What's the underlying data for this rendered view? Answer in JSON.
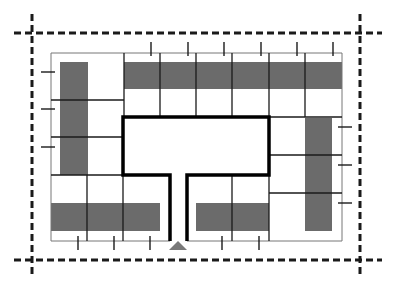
{
  "diagram": {
    "type": "site-plan",
    "colors": {
      "background": "#ffffff",
      "lines": "#1a1a1a",
      "gray_band": "#6b6b6b",
      "entrance_marker": "#7a7a7a"
    },
    "elements": {
      "setback_lines": {
        "style": "dashed",
        "count": 4
      },
      "site_boundary": {
        "style": "thin"
      },
      "courtyard": {
        "style": "thick",
        "shape": "T-shaped with entry corridor"
      },
      "entrance": {
        "icon": "triangle",
        "position": "bottom-center"
      },
      "units": {
        "top_row": 6,
        "left_column": 3,
        "right_column": 3,
        "bottom_left": 3,
        "bottom_right": 2
      },
      "ticks": {
        "top": 6,
        "left": 3,
        "right": 3,
        "bottom": 5
      }
    }
  }
}
